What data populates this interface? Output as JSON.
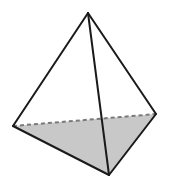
{
  "figure": {
    "name": "tetrahedron",
    "canvas": {
      "width": 169,
      "height": 189,
      "background": "#ffffff"
    },
    "style": {
      "edge_color": "#1a1a1a",
      "edge_width": 2.0,
      "base_fill": "#c8c8c8",
      "face_fill": "#ffffff",
      "hidden_edge_color": "#7a7a7a",
      "hidden_edge_width": 2.0,
      "hidden_edge_dash": "4 3"
    },
    "vertices": [
      {
        "id": "apex",
        "label": "apex",
        "x": 88,
        "y": 13
      },
      {
        "id": "left",
        "label": "back-left",
        "x": 13,
        "y": 126
      },
      {
        "id": "right",
        "label": "back-right",
        "x": 156,
        "y": 114
      },
      {
        "id": "front",
        "label": "front-bottom",
        "x": 109,
        "y": 175
      }
    ],
    "faces": [
      {
        "id": "base",
        "label": "base-triangle",
        "vertices": [
          "left",
          "right",
          "front"
        ],
        "fill": "#c8c8c8",
        "visible": true
      },
      {
        "id": "left-face",
        "label": "left-front-face",
        "vertices": [
          "apex",
          "left",
          "front"
        ],
        "fill": "#ffffff",
        "visible": true
      },
      {
        "id": "right-face",
        "label": "right-front-face",
        "vertices": [
          "apex",
          "right",
          "front"
        ],
        "fill": "#ffffff",
        "visible": true
      }
    ],
    "edges": [
      {
        "id": "apex-left",
        "label": "apex-to-back-left",
        "from": "apex",
        "to": "left",
        "hidden": false
      },
      {
        "id": "apex-right",
        "label": "apex-to-back-right",
        "from": "apex",
        "to": "right",
        "hidden": false
      },
      {
        "id": "apex-front",
        "label": "apex-to-front-bottom",
        "from": "apex",
        "to": "front",
        "hidden": false
      },
      {
        "id": "left-front",
        "label": "back-left-to-front",
        "from": "left",
        "to": "front",
        "hidden": false
      },
      {
        "id": "right-front",
        "label": "back-right-to-front",
        "from": "right",
        "to": "front",
        "hidden": false
      },
      {
        "id": "left-right",
        "label": "back-left-to-back-right",
        "from": "left",
        "to": "right",
        "hidden": true
      }
    ]
  }
}
